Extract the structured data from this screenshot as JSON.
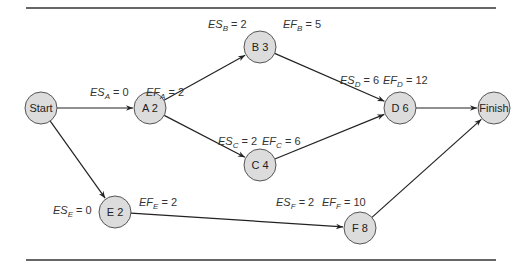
{
  "diagram": {
    "type": "activity-on-node network (critical path, forward pass)",
    "nodes": [
      {
        "id": "start",
        "label": "Start",
        "x": 41,
        "y": 108
      },
      {
        "id": "A",
        "label": "A 2",
        "x": 150,
        "y": 108,
        "es_label": "ES",
        "es_sub": "A",
        "es_val": " = 0",
        "ef_label": "EF",
        "ef_sub": "A",
        "ef_val": " = 2"
      },
      {
        "id": "B",
        "label": "B 3",
        "x": 260,
        "y": 47,
        "es_label": "ES",
        "es_sub": "B",
        "es_val": " = 2",
        "ef_label": "EF",
        "ef_sub": "B",
        "ef_val": " = 5"
      },
      {
        "id": "C",
        "label": "C 4",
        "x": 260,
        "y": 165,
        "es_label": "ES",
        "es_sub": "C",
        "es_val": " = 2",
        "ef_label": "EF",
        "ef_sub": "C",
        "ef_val": " = 6"
      },
      {
        "id": "D",
        "label": "D 6",
        "x": 400,
        "y": 108,
        "es_label": "ES",
        "es_sub": "D",
        "es_val": " = 6",
        "ef_label": "EF",
        "ef_sub": "D",
        "ef_val": " = 12"
      },
      {
        "id": "finish",
        "label": "Finish",
        "x": 494,
        "y": 108
      },
      {
        "id": "E",
        "label": "E 2",
        "x": 115,
        "y": 212,
        "es_label": "ES",
        "es_sub": "E",
        "es_val": " = 0",
        "ef_label": "EF",
        "ef_sub": "E",
        "ef_val": " = 2"
      },
      {
        "id": "F",
        "label": "F 8",
        "x": 360,
        "y": 228,
        "es_label": "ES",
        "es_sub": "F",
        "es_val": " = 2",
        "ef_label": "EF",
        "ef_sub": "F",
        "ef_val": " = 10"
      }
    ],
    "edges": [
      {
        "from": "start",
        "to": "A"
      },
      {
        "from": "start",
        "to": "E"
      },
      {
        "from": "A",
        "to": "B"
      },
      {
        "from": "A",
        "to": "C"
      },
      {
        "from": "B",
        "to": "D"
      },
      {
        "from": "C",
        "to": "D"
      },
      {
        "from": "D",
        "to": "finish"
      },
      {
        "from": "E",
        "to": "F"
      },
      {
        "from": "F",
        "to": "finish"
      }
    ],
    "colors": {
      "node_fill": "#dcdcdc",
      "node_stroke": "#555555",
      "edge": "#222222",
      "rule": "#333333"
    }
  }
}
